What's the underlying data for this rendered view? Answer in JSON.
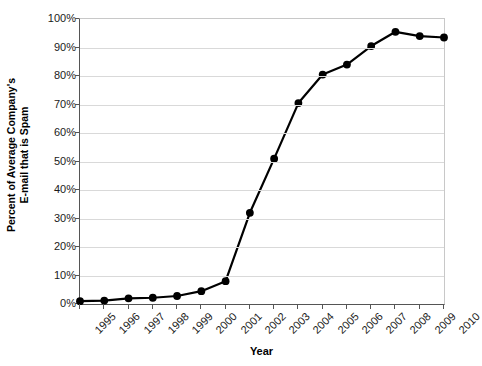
{
  "chart_data": {
    "type": "line",
    "title": "",
    "xlabel": "Year",
    "ylabel": "Percent of Average Company's E-mail that is Spam",
    "ylabel_lines": [
      "Percent of Average Company's",
      "E-mail that is Spam"
    ],
    "categories": [
      "1995",
      "1996",
      "1997",
      "1998",
      "1999",
      "2000",
      "2001",
      "2002",
      "2003",
      "2004",
      "2005",
      "2006",
      "2007",
      "2008",
      "2009",
      "2010"
    ],
    "values": [
      1,
      1.2,
      2,
      2.2,
      2.8,
      4.5,
      8,
      32,
      51,
      70.5,
      80.5,
      84,
      90.5,
      95.5,
      94,
      93.5
    ],
    "x": [
      1995,
      1996,
      1997,
      1998,
      1999,
      2000,
      2001,
      2002,
      2003,
      2004,
      2005,
      2006,
      2007,
      2008,
      2009,
      2010
    ],
    "ylim": [
      0,
      100
    ],
    "ytick_values": [
      0,
      10,
      20,
      30,
      40,
      50,
      60,
      70,
      80,
      90,
      100
    ],
    "ytick_labels": [
      "0%",
      "10%",
      "20%",
      "30%",
      "40%",
      "50%",
      "60%",
      "70%",
      "80%",
      "90%",
      "100%"
    ],
    "xtick_labels": [
      "1995",
      "1996",
      "1997",
      "1998",
      "1999",
      "2000",
      "2001",
      "2002",
      "2003",
      "2004",
      "2005",
      "2006",
      "2007",
      "2008",
      "2009",
      "2010"
    ],
    "grid": "horizontal",
    "legend": "none",
    "series_color": "#000000",
    "marker": "filled-circle",
    "gridline_color": "#d9d9d9",
    "axis_color": "#555555",
    "frame_color": "#c8c8c8",
    "background_color": "#ffffff"
  }
}
